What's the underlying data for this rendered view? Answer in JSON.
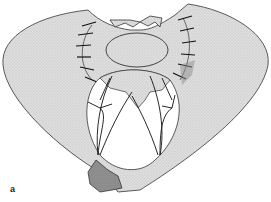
{
  "figure": {
    "panel_label": "a",
    "colors": {
      "tissue_fill": "#d9d9d9",
      "tissue_stroke": "#333333",
      "suture": "#111111",
      "opening_fill": "#ffffff",
      "dark_patch": "#8a8a8a"
    }
  }
}
